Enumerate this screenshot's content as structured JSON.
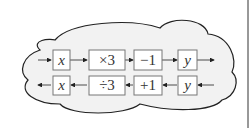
{
  "diagram": {
    "type": "function-machine",
    "forward_row": {
      "direction": "right",
      "boxes": [
        "x",
        "×3",
        "−1",
        "y"
      ]
    },
    "inverse_row": {
      "direction": "left",
      "boxes": [
        "x",
        "÷3",
        "+1",
        "y"
      ]
    }
  },
  "colors": {
    "box_stroke": "#777777",
    "cloud_fill": "#f2f2f2",
    "cloud_stroke": "#222222",
    "text": "#333333"
  }
}
